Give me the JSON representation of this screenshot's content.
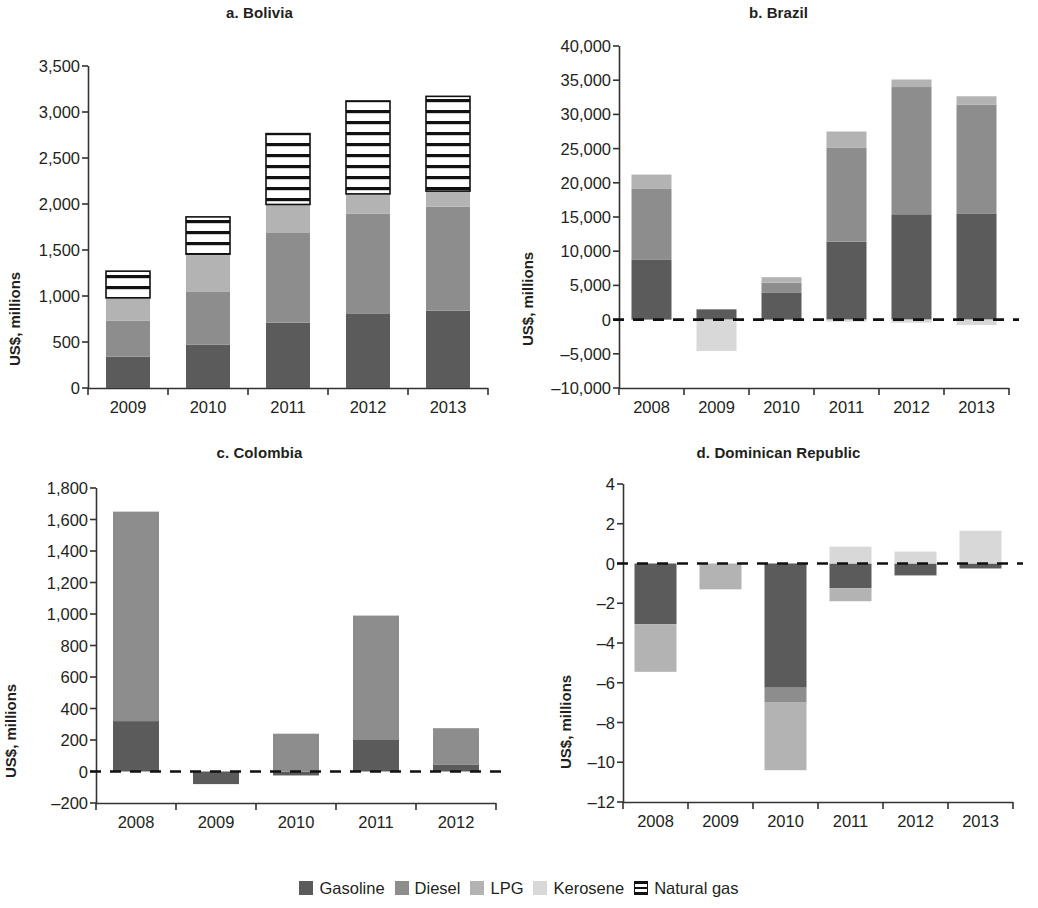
{
  "figure": {
    "ylabel": "US$, millions"
  },
  "legend": {
    "items": [
      {
        "label": "Gasoline",
        "key": "gasoline",
        "color": "#5b5b5b",
        "pattern": "solid"
      },
      {
        "label": "Diesel",
        "key": "diesel",
        "color": "#8d8d8d",
        "pattern": "solid"
      },
      {
        "label": "LPG",
        "key": "lpg",
        "color": "#b3b3b3",
        "pattern": "solid"
      },
      {
        "label": "Kerosene",
        "key": "kerosene",
        "color": "#d8d8d8",
        "pattern": "solid"
      },
      {
        "label": "Natural gas",
        "key": "natural_gas",
        "color": "#ffffff",
        "pattern": "horizontal-stripes"
      }
    ]
  },
  "chart_data": [
    {
      "type": "bar",
      "subtype": "stacked",
      "panel": "a",
      "title": "a. Bolivia",
      "xlabel": "",
      "ylabel": "US$, millions",
      "categories": [
        "2009",
        "2010",
        "2011",
        "2012",
        "2013"
      ],
      "ylim": [
        0,
        3500
      ],
      "yticks": [
        0,
        500,
        1000,
        1500,
        2000,
        2500,
        3000,
        3500
      ],
      "ytick_labels": [
        "0",
        "500",
        "1,000",
        "1,500",
        "2,000",
        "2,500",
        "3,000",
        "3,500"
      ],
      "grid": false,
      "zero_line": false,
      "series": [
        {
          "name": "Gasoline",
          "values": [
            340,
            470,
            710,
            805,
            840
          ]
        },
        {
          "name": "Diesel",
          "values": [
            390,
            580,
            975,
            1090,
            1130
          ]
        },
        {
          "name": "LPG",
          "values": [
            250,
            405,
            310,
            215,
            170
          ]
        },
        {
          "name": "Kerosene",
          "values": [
            0,
            0,
            0,
            0,
            0
          ]
        },
        {
          "name": "Natural gas",
          "values": [
            290,
            405,
            770,
            1010,
            1030
          ]
        }
      ],
      "totals": [
        1270,
        1860,
        2765,
        3120,
        3170
      ]
    },
    {
      "type": "bar",
      "subtype": "stacked",
      "panel": "b",
      "title": "b. Brazil",
      "xlabel": "",
      "ylabel": "US$, millions",
      "categories": [
        "2008",
        "2009",
        "2010",
        "2011",
        "2012",
        "2013"
      ],
      "ylim": [
        -10000,
        40000
      ],
      "yticks": [
        -10000,
        -5000,
        0,
        5000,
        10000,
        15000,
        20000,
        25000,
        30000,
        35000,
        40000
      ],
      "ytick_labels": [
        "–10,000",
        "–5,000",
        "0",
        "5,000",
        "10,000",
        "15,000",
        "20,000",
        "25,000",
        "30,000",
        "35,000",
        "40,000"
      ],
      "grid": false,
      "zero_line": true,
      "series": [
        {
          "name": "Gasoline",
          "values": [
            8800,
            1500,
            3900,
            11400,
            15400,
            15450
          ]
        },
        {
          "name": "Diesel",
          "values": [
            10300,
            0,
            1500,
            13700,
            18600,
            16000
          ]
        },
        {
          "name": "LPG",
          "values": [
            2100,
            0,
            800,
            2400,
            1100,
            1200
          ]
        },
        {
          "name": "Kerosene",
          "values": [
            0,
            -4600,
            0,
            -300,
            -450,
            -800
          ]
        }
      ],
      "totals": [
        21200,
        1500,
        6200,
        27500,
        35100,
        32650
      ]
    },
    {
      "type": "bar",
      "subtype": "stacked",
      "panel": "c",
      "title": "c. Colombia",
      "xlabel": "",
      "ylabel": "US$, millions",
      "categories": [
        "2008",
        "2009",
        "2010",
        "2011",
        "2012"
      ],
      "ylim": [
        -200,
        1800
      ],
      "yticks": [
        -200,
        0,
        200,
        400,
        600,
        800,
        1000,
        1200,
        1400,
        1600,
        1800
      ],
      "ytick_labels": [
        "–200",
        "0",
        "200",
        "400",
        "600",
        "800",
        "1,000",
        "1,200",
        "1,400",
        "1,600",
        "1,800"
      ],
      "grid": false,
      "zero_line": true,
      "series": [
        {
          "name": "Gasoline",
          "values": [
            320,
            -80,
            -25,
            200,
            45
          ]
        },
        {
          "name": "Diesel",
          "values": [
            1330,
            0,
            240,
            790,
            230
          ]
        },
        {
          "name": "LPG",
          "values": [
            0,
            0,
            0,
            0,
            0
          ]
        }
      ],
      "totals": [
        1650,
        -80,
        215,
        990,
        275
      ]
    },
    {
      "type": "bar",
      "subtype": "stacked",
      "panel": "d",
      "title": "d. Dominican Republic",
      "xlabel": "",
      "ylabel": "US$, millions",
      "categories": [
        "2008",
        "2009",
        "2010",
        "2011",
        "2012",
        "2013"
      ],
      "ylim": [
        -12,
        4
      ],
      "yticks": [
        -12,
        -10,
        -8,
        -6,
        -4,
        -2,
        0,
        2,
        4
      ],
      "ytick_labels": [
        "–12",
        "–10",
        "–8",
        "–6",
        "–4",
        "–2",
        "0",
        "2",
        "4"
      ],
      "grid": false,
      "zero_line": true,
      "series": [
        {
          "name": "Gasoline",
          "values": [
            -3.05,
            0,
            -6.25,
            -1.25,
            -0.6,
            -0.25
          ]
        },
        {
          "name": "Diesel",
          "values": [
            0,
            0,
            -0.75,
            0,
            0,
            0
          ]
        },
        {
          "name": "LPG",
          "values": [
            -2.4,
            -1.3,
            -3.4,
            -0.65,
            0,
            0
          ]
        },
        {
          "name": "Kerosene",
          "values": [
            0,
            0,
            0,
            0.85,
            0.6,
            1.65
          ]
        }
      ],
      "totals": [
        -5.45,
        -1.3,
        -10.4,
        -1.05,
        0.0,
        1.4
      ]
    }
  ]
}
